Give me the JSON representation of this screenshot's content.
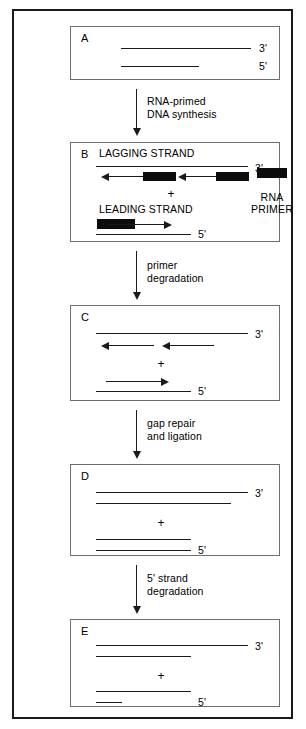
{
  "figure": {
    "accent_color": "#0c0c0c",
    "frame_color": "#1a1a1a",
    "panel_border_color": "#6e6e6e"
  },
  "panels": [
    {
      "letter": "A",
      "three_prime_label": "3'",
      "five_prime_label": "5'",
      "strand_titles": [],
      "plus_label": ""
    },
    {
      "letter": "B",
      "three_prime_label": "3'",
      "five_prime_label": "5'",
      "strand_titles": [
        "LAGGING STRAND",
        "LEADING STRAND"
      ],
      "plus_label": "+"
    },
    {
      "letter": "C",
      "three_prime_label": "3'",
      "five_prime_label": "5'",
      "strand_titles": [],
      "plus_label": "+"
    },
    {
      "letter": "D",
      "three_prime_label": "3'",
      "five_prime_label": "5'",
      "strand_titles": [],
      "plus_label": "+"
    },
    {
      "letter": "E",
      "three_prime_label": "3'",
      "five_prime_label": "5'",
      "strand_titles": [],
      "plus_label": "+"
    }
  ],
  "transitions": [
    {
      "line1": "RNA-primed",
      "line2": "DNA synthesis"
    },
    {
      "line1": "primer",
      "line2": "degradation"
    },
    {
      "line1": "gap repair",
      "line2": "and ligation"
    },
    {
      "line1": "5' strand",
      "line2": "degradation"
    }
  ],
  "legend": {
    "line1": "RNA",
    "line2": "PRIMER",
    "swatch_color": "#0c0c0c"
  }
}
